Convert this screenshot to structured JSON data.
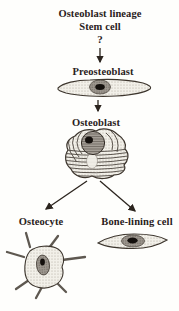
{
  "diagram": {
    "header": {
      "line1": "Osteoblast lineage",
      "line2": "Stem cell",
      "uncertainty_mark": "?"
    },
    "nodes": {
      "preosteoblast": {
        "label": "Preosteoblast",
        "shape": "spindle-cell-drawing"
      },
      "osteoblast": {
        "label": "Osteoblast",
        "shape": "round-cell-with-er-drawing"
      },
      "osteocyte": {
        "label": "Osteocyte",
        "shape": "stellate-cell-drawing"
      },
      "bone_lining": {
        "label": "Bone-lining cell",
        "shape": "flat-spindle-cell-drawing"
      }
    },
    "edges": [
      {
        "from": "stem-cell",
        "to": "preosteoblast"
      },
      {
        "from": "preosteoblast",
        "to": "osteoblast"
      },
      {
        "from": "osteoblast",
        "to": "osteocyte"
      },
      {
        "from": "osteoblast",
        "to": "bone_lining"
      }
    ],
    "colors": {
      "background": "#fefefc",
      "text": "#29211b",
      "outline": "#3d362e",
      "cell_fill": "#f2f0e9",
      "stipple_dot": "#aba49a",
      "nucleus_fill": "#9e9890",
      "nucleolus": "#14100d",
      "arrow": "#2b241e",
      "er_line": "#4c453e",
      "process": "#5e5850"
    }
  }
}
